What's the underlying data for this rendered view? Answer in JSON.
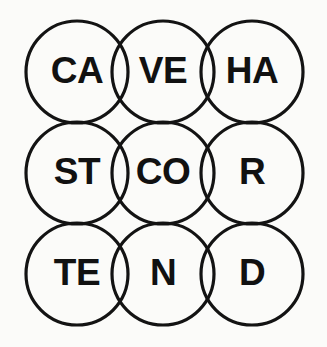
{
  "canvas": {
    "width": 327,
    "height": 347,
    "background_color": "#fbfbf9",
    "ink_color": "#131313",
    "text_color": "#111111"
  },
  "grid": {
    "rows": 3,
    "columns": 3,
    "circle_diameter": 102,
    "stroke_width": 3.2,
    "column_centers": [
      77,
      163,
      252
    ],
    "row_centers": [
      72,
      173,
      274
    ]
  },
  "cells": [
    {
      "id": "cell-r1c1",
      "row": 1,
      "column": 1,
      "label": "CA",
      "cx": 77,
      "cy": 72,
      "r": 51
    },
    {
      "id": "cell-r1c2",
      "row": 1,
      "column": 2,
      "label": "VE",
      "cx": 163,
      "cy": 72,
      "r": 51
    },
    {
      "id": "cell-r1c3",
      "row": 1,
      "column": 3,
      "label": "HA",
      "cx": 252,
      "cy": 72,
      "r": 51
    },
    {
      "id": "cell-r2c1",
      "row": 2,
      "column": 1,
      "label": "ST",
      "cx": 77,
      "cy": 173,
      "r": 51
    },
    {
      "id": "cell-r2c2",
      "row": 2,
      "column": 2,
      "label": "CO",
      "cx": 163,
      "cy": 173,
      "r": 51
    },
    {
      "id": "cell-r2c3",
      "row": 2,
      "column": 3,
      "label": "R",
      "cx": 252,
      "cy": 173,
      "r": 51
    },
    {
      "id": "cell-r3c1",
      "row": 3,
      "column": 1,
      "label": "TE",
      "cx": 77,
      "cy": 274,
      "r": 51
    },
    {
      "id": "cell-r3c2",
      "row": 3,
      "column": 2,
      "label": "N",
      "cx": 163,
      "cy": 274,
      "r": 51
    },
    {
      "id": "cell-r3c3",
      "row": 3,
      "column": 3,
      "label": "D",
      "cx": 252,
      "cy": 274,
      "r": 51
    }
  ]
}
